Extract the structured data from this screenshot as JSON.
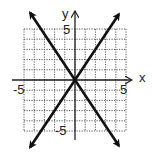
{
  "chart_data": {
    "type": "line",
    "title": "",
    "xlabel": "x",
    "ylabel": "y",
    "xlim": [
      -5,
      5
    ],
    "ylim": [
      -5,
      5
    ],
    "grid": true,
    "grid_style": "dotted",
    "tick_labels": {
      "x": [
        "-5",
        "5"
      ],
      "y": [
        "5",
        "-5"
      ]
    },
    "series": [
      {
        "name": "line-1",
        "equation": "y = -3/2 x",
        "slope": -1.5,
        "intercept": 0,
        "points": [
          [
            -4.4,
            6.6
          ],
          [
            0,
            0
          ],
          [
            4.3,
            -6.45
          ]
        ],
        "arrows": "both"
      },
      {
        "name": "line-2",
        "equation": "y = 3/2 x",
        "slope": 1.5,
        "intercept": 0,
        "points": [
          [
            -4.4,
            -6.6
          ],
          [
            0,
            0
          ],
          [
            4.3,
            6.45
          ]
        ],
        "arrows": "both"
      }
    ],
    "intersection": [
      0,
      0
    ],
    "colors": {
      "lines": "#111111",
      "grid": "#555555",
      "axes": "#222222"
    }
  },
  "labels": {
    "x_axis": "x",
    "y_axis": "y",
    "x_min": "-5",
    "x_max": "5",
    "y_max": "5",
    "y_min": "-5"
  }
}
